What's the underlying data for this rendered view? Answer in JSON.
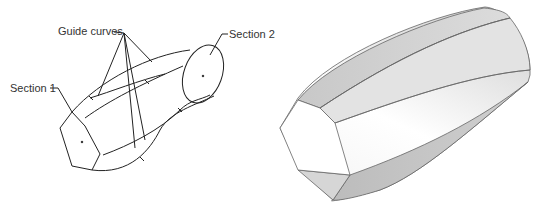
{
  "wireframe": {
    "labels": {
      "guide_curves": "Guide curves",
      "section_1": "Section 1",
      "section_2": "Section 2"
    },
    "line_color": "#222222"
  },
  "shaded_model": {
    "face_light": "#ffffff",
    "face_mid": "#e6e6e6",
    "face_dark": "#bdbdbd",
    "edge_color": "#555555"
  }
}
